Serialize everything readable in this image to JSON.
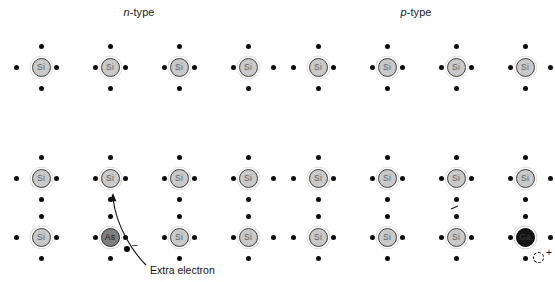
{
  "figure": {
    "width": 555,
    "height": 282,
    "background": "#ffffff"
  },
  "panels": [
    {
      "id": "n-type",
      "title_symbol": "n",
      "title_rest": "-type",
      "host_atom_label": "Si",
      "dopant_label": "As",
      "dopant_position": {
        "row": 2,
        "col": 1
      },
      "dopant_color": "#7f7f7f",
      "carrier": {
        "type": "electron",
        "sign": "–",
        "annotation": "Extra electron"
      }
    },
    {
      "id": "p-type",
      "title_symbol": "p",
      "title_rest": "-type",
      "host_atom_label": "Si",
      "dopant_label": "Ga",
      "dopant_position": {
        "row": 2,
        "col": 3
      },
      "dopant_color": "#141414",
      "carrier": {
        "type": "hole",
        "sign": "+",
        "annotation": "Hole"
      }
    }
  ],
  "lattice": {
    "rows": 3,
    "cols": 4,
    "atom_label": "Si",
    "atom_fill": "#c9c9c9",
    "atom_stroke": "#3d3d3d",
    "electron_dot_color": "#0b0b0b",
    "col_x": [
      41,
      110,
      179,
      248
    ],
    "row_y": [
      67,
      178,
      237
    ],
    "panel_offsets": [
      0,
      297
    ]
  },
  "colors": {
    "background": "#ffffff",
    "si_fill": "#c9c9c9",
    "as_fill": "#7f7f7f",
    "ga_fill": "#141414",
    "dot": "#0b0b0b",
    "text": "#111111"
  }
}
